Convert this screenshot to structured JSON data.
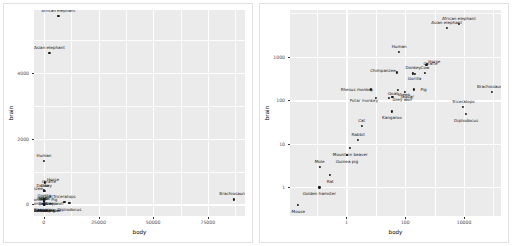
{
  "figure": {
    "count": 2,
    "background": "#ffffff",
    "panel_fill": "#ebebeb",
    "grid_color": "#ffffff",
    "point_color": "#1a1a1a",
    "label_color": "#111111"
  },
  "chart_data": [
    {
      "type": "scatter",
      "title": "",
      "xlabel": "body",
      "ylabel": "brain",
      "xscale": "linear",
      "yscale": "linear",
      "xlim": [
        -4500,
        92000
      ],
      "ylim": [
        -350,
        5900
      ],
      "xticks": [
        "0",
        "25000",
        "50000",
        "75000"
      ],
      "xtick_values": [
        0,
        25000,
        50000,
        75000
      ],
      "yticks": [
        "0",
        "2000",
        "4000"
      ],
      "ytick_values": [
        0,
        2000,
        4000
      ],
      "grid": true,
      "legend": "none",
      "points": [
        {
          "label": "Mountain beaver",
          "body": 1.35,
          "brain": 8.1
        },
        {
          "label": "Cow",
          "body": 465,
          "brain": 423
        },
        {
          "label": "Grey wolf",
          "body": 36.33,
          "brain": 119.5
        },
        {
          "label": "Goat",
          "body": 27.66,
          "brain": 115
        },
        {
          "label": "Guinea pig",
          "body": 1.04,
          "brain": 5.5
        },
        {
          "label": "Dipliodocus",
          "body": 11700,
          "brain": 50
        },
        {
          "label": "Asian elephant",
          "body": 2547,
          "brain": 4603
        },
        {
          "label": "Donkey",
          "body": 187.1,
          "brain": 419
        },
        {
          "label": "Horse",
          "body": 521,
          "brain": 655
        },
        {
          "label": "Potar monkey",
          "body": 10,
          "brain": 115
        },
        {
          "label": "Cat",
          "body": 3.3,
          "brain": 25.6
        },
        {
          "label": "Giraffe",
          "body": 529,
          "brain": 680
        },
        {
          "label": "Gorilla",
          "body": 207,
          "brain": 406
        },
        {
          "label": "Human",
          "body": 62,
          "brain": 1320
        },
        {
          "label": "African elephant",
          "body": 6654,
          "brain": 5712
        },
        {
          "label": "Triceratops",
          "body": 9400,
          "brain": 70
        },
        {
          "label": "Rhesus monkey",
          "body": 6.8,
          "brain": 179
        },
        {
          "label": "Kangaroo",
          "body": 35,
          "brain": 56
        },
        {
          "label": "Golden hamster",
          "body": 0.12,
          "brain": 1
        },
        {
          "label": "Mouse",
          "body": 0.023,
          "brain": 0.4
        },
        {
          "label": "Rabbit",
          "body": 2.5,
          "brain": 12.1
        },
        {
          "label": "Sheep",
          "body": 55.5,
          "brain": 175
        },
        {
          "label": "Jaguar",
          "body": 100,
          "brain": 157
        },
        {
          "label": "Chimpanzee",
          "body": 52.16,
          "brain": 440
        },
        {
          "label": "Rat",
          "body": 0.28,
          "brain": 1.9
        },
        {
          "label": "Brachiosaurus",
          "body": 87000,
          "brain": 154.5
        },
        {
          "label": "Mole",
          "body": 0.122,
          "brain": 3
        },
        {
          "label": "Pig",
          "body": 192,
          "brain": 180
        }
      ]
    },
    {
      "type": "scatter",
      "title": "",
      "xlabel": "body",
      "ylabel": "brain",
      "xscale": "log10",
      "yscale": "log10",
      "xlim": [
        0.012,
        180000
      ],
      "ylim": [
        0.22,
        12000
      ],
      "xticks": [
        "1",
        "100",
        "10000"
      ],
      "xtick_values": [
        1,
        100,
        10000
      ],
      "yticks": [
        "1",
        "10",
        "100",
        "1000"
      ],
      "ytick_values": [
        1,
        10,
        100,
        1000
      ],
      "grid": true,
      "legend": "none",
      "points": [
        {
          "label": "Mountain beaver",
          "body": 1.35,
          "brain": 8.1
        },
        {
          "label": "Cow",
          "body": 465,
          "brain": 423
        },
        {
          "label": "Grey wolf",
          "body": 36.33,
          "brain": 119.5
        },
        {
          "label": "Goat",
          "body": 27.66,
          "brain": 115
        },
        {
          "label": "Guinea pig",
          "body": 1.04,
          "brain": 5.5
        },
        {
          "label": "Dipliodocus",
          "body": 11700,
          "brain": 50
        },
        {
          "label": "Asian elephant",
          "body": 2547,
          "brain": 4603
        },
        {
          "label": "Donkey",
          "body": 187.1,
          "brain": 419
        },
        {
          "label": "Horse",
          "body": 521,
          "brain": 655
        },
        {
          "label": "Potar monkey",
          "body": 10,
          "brain": 115
        },
        {
          "label": "Cat",
          "body": 3.3,
          "brain": 25.6
        },
        {
          "label": "Giraffe",
          "body": 529,
          "brain": 680
        },
        {
          "label": "Gorilla",
          "body": 207,
          "brain": 406
        },
        {
          "label": "Human",
          "body": 62,
          "brain": 1320
        },
        {
          "label": "African elephant",
          "body": 6654,
          "brain": 5712
        },
        {
          "label": "Triceratops",
          "body": 9400,
          "brain": 70
        },
        {
          "label": "Rhesus monkey",
          "body": 6.8,
          "brain": 179
        },
        {
          "label": "Kangaroo",
          "body": 35,
          "brain": 56
        },
        {
          "label": "Golden hamster",
          "body": 0.12,
          "brain": 1
        },
        {
          "label": "Mouse",
          "body": 0.023,
          "brain": 0.4
        },
        {
          "label": "Rabbit",
          "body": 2.5,
          "brain": 12.1
        },
        {
          "label": "Sheep",
          "body": 55.5,
          "brain": 175
        },
        {
          "label": "Jaguar",
          "body": 100,
          "brain": 157
        },
        {
          "label": "Chimpanzee",
          "body": 52.16,
          "brain": 440
        },
        {
          "label": "Rat",
          "body": 0.28,
          "brain": 1.9
        },
        {
          "label": "Brachiosaurus",
          "body": 87000,
          "brain": 154.5
        },
        {
          "label": "Mole",
          "body": 0.122,
          "brain": 3
        },
        {
          "label": "Pig",
          "body": 192,
          "brain": 180
        }
      ]
    }
  ]
}
